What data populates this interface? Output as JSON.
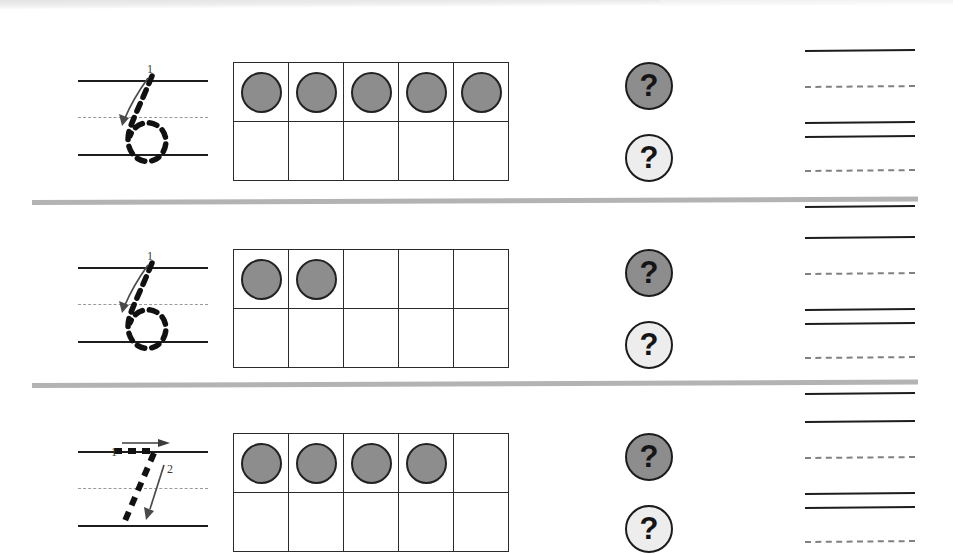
{
  "worksheet": {
    "title": "Number tracing and ten-frame counting worksheet",
    "colors": {
      "ink": "#1d1d1d",
      "counter_fill": "#8d8d8d",
      "badge_dark": "#8d8d8d",
      "badge_light": "#ededed",
      "separator": "#b3b3b3",
      "dashed_guide": "#9a9a9a"
    },
    "badge_symbol": "?",
    "rows": [
      {
        "id": "row-1",
        "trace": {
          "numeral": "6",
          "strokes": [
            {
              "label": "1",
              "kind": "curve-down-and-loop"
            }
          ]
        },
        "ten_frame": {
          "columns": 5,
          "rows": 2,
          "filled_count": 5,
          "cells": [
            [
              true,
              true,
              true,
              true,
              true
            ],
            [
              false,
              false,
              false,
              false,
              false
            ]
          ]
        },
        "badges": [
          {
            "style": "dark",
            "symbol": "?"
          },
          {
            "style": "light",
            "symbol": "?"
          }
        ],
        "writing_lines": [
          "solid",
          "dashed",
          "solid",
          "solid",
          "dashed",
          "solid"
        ]
      },
      {
        "id": "row-2",
        "trace": {
          "numeral": "6",
          "strokes": [
            {
              "label": "1",
              "kind": "curve-down-and-loop"
            }
          ]
        },
        "ten_frame": {
          "columns": 5,
          "rows": 2,
          "filled_count": 2,
          "cells": [
            [
              true,
              true,
              false,
              false,
              false
            ],
            [
              false,
              false,
              false,
              false,
              false
            ]
          ]
        },
        "badges": [
          {
            "style": "dark",
            "symbol": "?"
          },
          {
            "style": "light",
            "symbol": "?"
          }
        ],
        "writing_lines": [
          "solid",
          "dashed",
          "solid",
          "solid",
          "dashed",
          "solid"
        ]
      },
      {
        "id": "row-3",
        "trace": {
          "numeral": "7",
          "strokes": [
            {
              "label": "1",
              "kind": "horizontal-right"
            },
            {
              "label": "2",
              "kind": "diagonal-down-left"
            }
          ]
        },
        "ten_frame": {
          "columns": 5,
          "rows": 2,
          "filled_count": 4,
          "cells": [
            [
              true,
              true,
              true,
              true,
              false
            ],
            [
              false,
              false,
              false,
              false,
              false
            ]
          ]
        },
        "badges": [
          {
            "style": "dark",
            "symbol": "?"
          },
          {
            "style": "light",
            "symbol": "?"
          }
        ],
        "writing_lines": [
          "solid",
          "dashed",
          "solid",
          "solid",
          "dashed",
          "solid"
        ]
      }
    ]
  }
}
